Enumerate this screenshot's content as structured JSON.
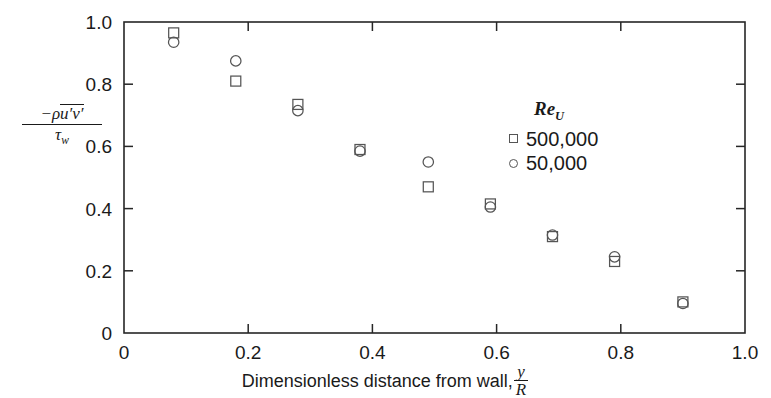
{
  "chart_data": {
    "type": "scatter",
    "title": "",
    "xlabel": "Dimensionless distance from wall,",
    "xlabel_fraction_num": "y",
    "xlabel_fraction_den": "R",
    "ylabel_minus": "−ρ",
    "ylabel_overbar": "u′v′",
    "ylabel_den": "τ",
    "ylabel_den_sub": "w",
    "xlim": [
      0,
      1.0
    ],
    "ylim": [
      0,
      1.0
    ],
    "xticks": [
      "0",
      "0.2",
      "0.4",
      "0.6",
      "0.8",
      "1.0"
    ],
    "xtickvals": [
      0,
      0.2,
      0.4,
      0.6,
      0.8,
      1.0
    ],
    "yticks": [
      "0",
      "0.2",
      "0.4",
      "0.6",
      "0.8",
      "1.0"
    ],
    "ytickvals": [
      0,
      0.2,
      0.4,
      0.6,
      0.8,
      1.0
    ],
    "grid": false,
    "legend_position": "upper-right-inside",
    "legend_title": "Re",
    "legend_title_sub": "U",
    "series": [
      {
        "name": "500,000",
        "marker": "square",
        "x": [
          0.08,
          0.18,
          0.28,
          0.38,
          0.49,
          0.59,
          0.69,
          0.79,
          0.9
        ],
        "values": [
          0.965,
          0.81,
          0.735,
          0.59,
          0.47,
          0.415,
          0.31,
          0.23,
          0.1
        ]
      },
      {
        "name": "50,000",
        "marker": "circle",
        "x": [
          0.08,
          0.18,
          0.28,
          0.38,
          0.49,
          0.59,
          0.69,
          0.79,
          0.9
        ],
        "values": [
          0.935,
          0.875,
          0.715,
          0.585,
          0.55,
          0.405,
          0.315,
          0.245,
          0.095
        ]
      }
    ]
  },
  "axes": {
    "x_label_text": "Dimensionless distance from wall,",
    "x_fraction_numerator": "y",
    "x_fraction_denominator": "R",
    "y_numerator_minus_rho": "−ρ",
    "y_numerator_fluct": "u′v′",
    "y_denominator_tau": "τ",
    "y_denominator_sub": "w"
  },
  "legend": {
    "title": "Re",
    "title_subscript": "U",
    "entries": [
      {
        "marker": "square-icon",
        "label": "500,000"
      },
      {
        "marker": "circle-icon",
        "label": "50,000"
      }
    ]
  },
  "colors": {
    "axis": "#262626",
    "marker": "#555555",
    "text": "#1a1a1a",
    "background": "#ffffff"
  }
}
